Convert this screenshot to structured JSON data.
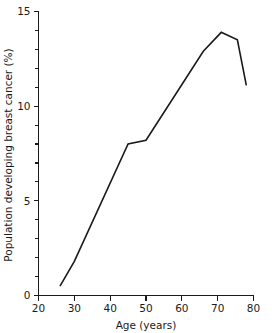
{
  "chart_data": {
    "type": "line",
    "title": "",
    "xlabel": "Age (years)",
    "ylabel": "Population developing breast cancer (%)",
    "xlim": [
      20,
      80
    ],
    "ylim": [
      0,
      15
    ],
    "grid": false,
    "legend": false,
    "x_major_ticks": [
      20,
      30,
      40,
      50,
      60,
      70,
      80
    ],
    "x_tick_labels": [
      "20",
      "30",
      "40",
      "50",
      "60",
      "70",
      "80"
    ],
    "y_major_ticks": [
      0,
      5,
      10,
      15
    ],
    "y_tick_labels": [
      "0",
      "5",
      "10",
      "15"
    ],
    "y_minor_ticks": [
      1,
      2,
      3,
      4,
      6,
      7,
      8,
      9,
      11,
      12,
      13,
      14
    ],
    "series": [
      {
        "name": "Population developing breast cancer",
        "color": "#1a1a1a",
        "x": [
          26,
          30,
          45,
          50,
          66,
          71,
          75.5,
          78
        ],
        "values": [
          0.5,
          1.8,
          8.0,
          8.2,
          12.9,
          13.9,
          13.5,
          11.1
        ]
      }
    ]
  },
  "axis": {
    "x_title": "Age (years)",
    "y_title": "Population developing breast cancer (%)"
  },
  "colors": {
    "line": "#1a1a1a",
    "axis": "#1a1a1a",
    "background": "#ffffff"
  }
}
